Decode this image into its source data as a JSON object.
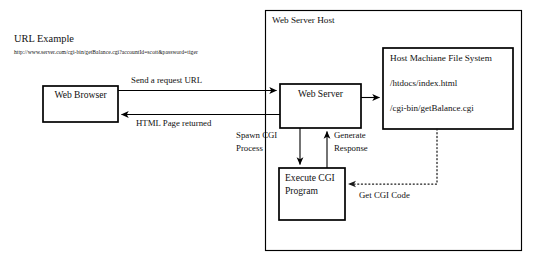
{
  "annotations": {
    "url_example_heading": "URL Example",
    "url_example_value": "http://www.server.com/cgi-bin/getBalance.cgi?accountId=scott&password=tiger"
  },
  "containers": {
    "web_server_host": {
      "label": "Web Server Host"
    },
    "file_system": {
      "label": "Host Machiane File System",
      "entries": [
        "/htdocs/index.html",
        "/cgi-bin/getBalance.cgi"
      ]
    }
  },
  "nodes": {
    "web_browser": {
      "label": "Web Browser"
    },
    "web_server": {
      "label": "Web Server"
    },
    "execute_cgi": {
      "label_line1": "Execute CGI",
      "label_line2": "Program"
    }
  },
  "edges": {
    "request": {
      "label": "Send a request URL"
    },
    "response": {
      "label": "HTML Page returned"
    },
    "spawn": {
      "label_line1": "Spawn CGI",
      "label_line2": "Process"
    },
    "generate": {
      "label_line1": "Generate",
      "label_line2": "Response"
    },
    "get_code": {
      "label": "Get CGI Code"
    },
    "file_lookup": {
      "label": ""
    }
  },
  "style": {
    "stroke": "#000000",
    "background": "#ffffff",
    "dotted_stroke": "#3a3a3a"
  }
}
